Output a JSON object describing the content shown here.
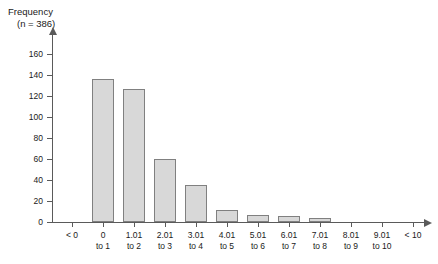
{
  "chart_data": {
    "type": "bar",
    "title": "Frequency",
    "subtitle": "(n = 386)",
    "xlabel": "",
    "ylabel": "",
    "ylim": [
      0,
      160
    ],
    "ytick_step": 20,
    "grid": false,
    "legend": null,
    "bar_fill_color": "#d8d8d8",
    "bar_border_color": "#808080",
    "axis_color": "#5a5a5a",
    "yticks": [
      0,
      20,
      40,
      60,
      80,
      100,
      120,
      140,
      160
    ],
    "categories": [
      "< 0",
      "0 to 1",
      "1.01 to 2",
      "2.01 to 3",
      "3.01 to 4",
      "4.01 to 5",
      "5.01 to 6",
      "6.01 to 7",
      "7.01 to 8",
      "8.01 to 9",
      "9.01 to 10",
      "< 10"
    ],
    "category_lines": [
      [
        "< 0",
        ""
      ],
      [
        "0",
        "to 1"
      ],
      [
        "1.01",
        "to 2"
      ],
      [
        "2.01",
        "to 3"
      ],
      [
        "3.01",
        "to 4"
      ],
      [
        "4.01",
        "to 5"
      ],
      [
        "5.01",
        "to 6"
      ],
      [
        "6.01",
        "to 7"
      ],
      [
        "7.01",
        "to 8"
      ],
      [
        "8.01",
        "to 9"
      ],
      [
        "9.01",
        "to 10"
      ],
      [
        "< 10",
        ""
      ]
    ],
    "values": [
      0,
      136,
      127,
      60,
      35,
      11,
      7,
      6,
      4,
      0,
      0,
      0
    ]
  }
}
